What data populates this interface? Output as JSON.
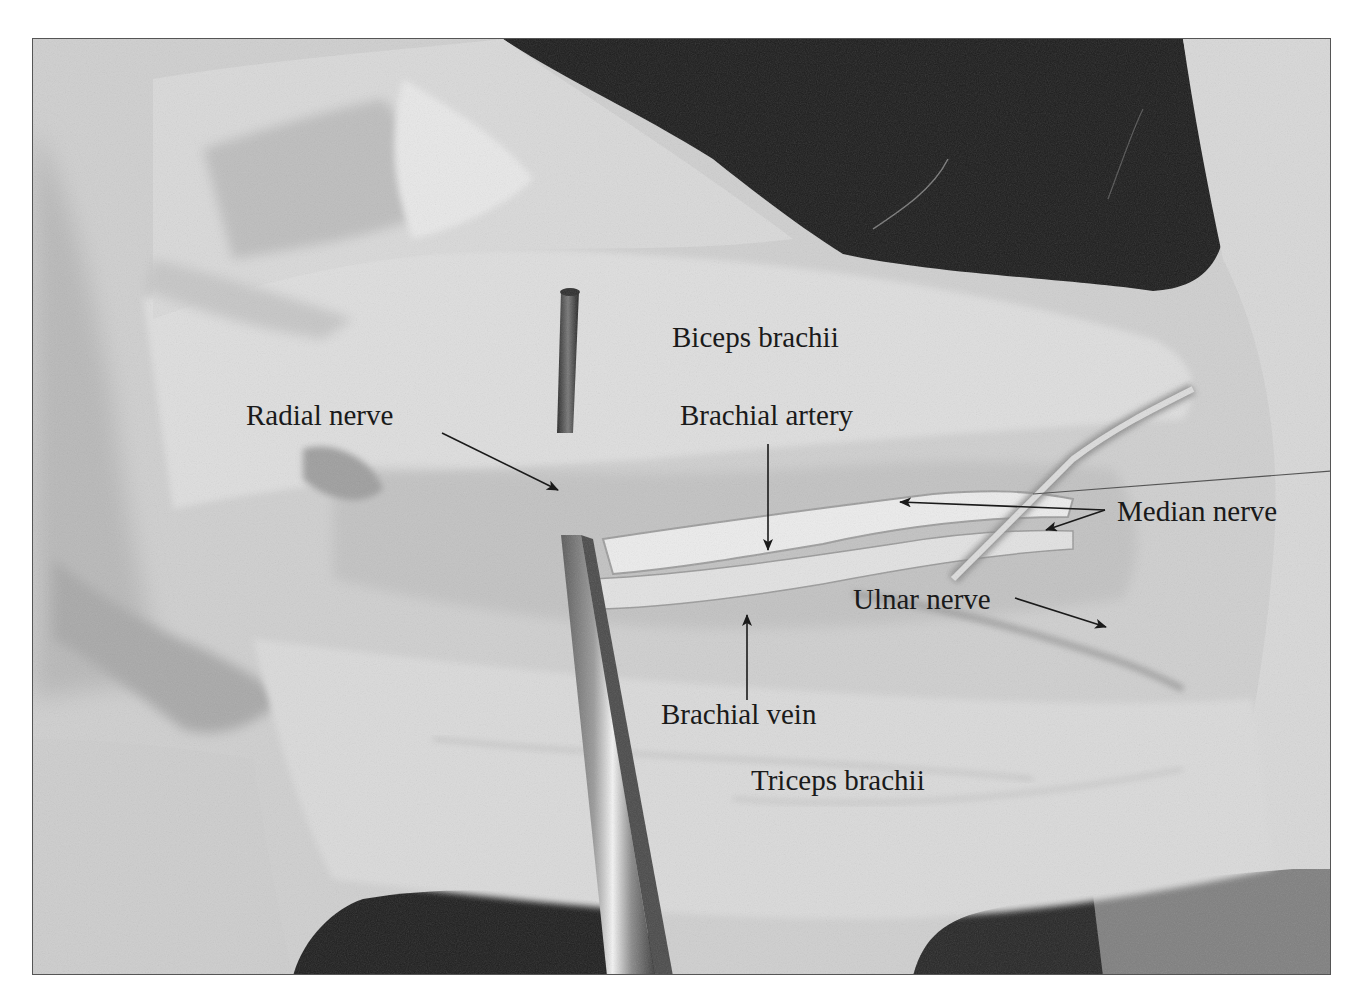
{
  "figure": {
    "colors": {
      "tissue_light": "#e6e6e6",
      "tissue_mid": "#c4c4c4",
      "tissue_shadow": "#9a9a9a",
      "background_dark": "#1e1e1e",
      "label_text": "#1a1a1a",
      "border": "#555555"
    },
    "labels": [
      {
        "id": "biceps-brachii",
        "text": "Biceps brachii",
        "x": 672,
        "y": 323
      },
      {
        "id": "radial-nerve",
        "text": "Radial nerve",
        "x": 246,
        "y": 401
      },
      {
        "id": "brachial-artery",
        "text": "Brachial artery",
        "x": 680,
        "y": 401
      },
      {
        "id": "median-nerve",
        "text": "Median nerve",
        "x": 1117,
        "y": 497
      },
      {
        "id": "ulnar-nerve",
        "text": "Ulnar nerve",
        "x": 853,
        "y": 585
      },
      {
        "id": "brachial-vein",
        "text": "Brachial vein",
        "x": 661,
        "y": 700
      },
      {
        "id": "triceps-brachii",
        "text": "Triceps brachii",
        "x": 751,
        "y": 766
      }
    ]
  }
}
